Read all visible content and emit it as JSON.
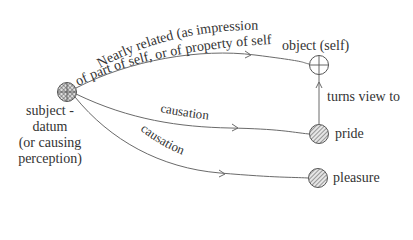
{
  "diagram": {
    "nodes": {
      "subject": {
        "label_lines": [
          "subject -",
          "datum",
          "(or causing",
          "perception)"
        ],
        "style": "cross-hatched"
      },
      "object": {
        "label": "object (self)",
        "style": "open-circle-crosshair"
      },
      "pride": {
        "label": "pride",
        "style": "diagonal-hatched"
      },
      "pleasure": {
        "label": "pleasure",
        "style": "diagonal-hatched"
      }
    },
    "edges": {
      "subject_to_object": {
        "label_line1": "Nearly related (as impression",
        "label_line2": "of part of self, or of property of self, etc.)"
      },
      "subject_to_pride": {
        "label": "causation"
      },
      "subject_to_pleasure": {
        "label": "causation"
      },
      "pride_to_object": {
        "label": "turns view to"
      }
    },
    "colors": {
      "line": "#6a6a6a",
      "text": "#333333",
      "hatch": "#555555"
    }
  }
}
